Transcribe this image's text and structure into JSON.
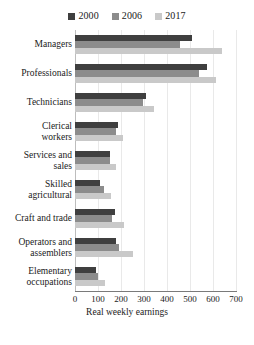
{
  "chart_data": {
    "type": "bar",
    "orientation": "horizontal",
    "title": "",
    "xlabel": "Real weekly earnings",
    "ylabel": "",
    "xlim": [
      0,
      700
    ],
    "xticks": [
      0,
      100,
      200,
      300,
      400,
      500,
      600,
      700
    ],
    "grid": true,
    "legend_position": "top-center",
    "categories": [
      "Managers",
      "Professionals",
      "Technicians",
      "Clerical\nworkers",
      "Services and\nsales",
      "Skilled\nagricultural",
      "Craft and trade",
      "Operators and\nassemblers",
      "Elementary\noccupations"
    ],
    "series": [
      {
        "name": "2000",
        "color": "#3f3f3f",
        "values": [
          510,
          575,
          310,
          185,
          150,
          108,
          173,
          180,
          90
        ]
      },
      {
        "name": "2006",
        "color": "#8c8c8c",
        "values": [
          455,
          540,
          295,
          180,
          150,
          125,
          160,
          190,
          100
        ]
      },
      {
        "name": "2017",
        "color": "#c9c9c9",
        "values": [
          640,
          615,
          345,
          208,
          178,
          155,
          215,
          250,
          130
        ]
      }
    ]
  },
  "colors": {
    "series_2000": "#3f3f3f",
    "series_2006": "#8c8c8c",
    "series_2017": "#c9c9c9",
    "gridline": "#e9e9e9",
    "axis": "#7a7a7a",
    "text": "#1a1a1a",
    "background": "#ffffff"
  }
}
